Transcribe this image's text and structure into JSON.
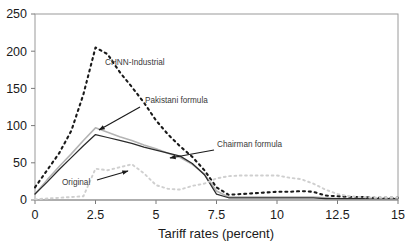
{
  "chart_data": {
    "type": "line",
    "title": "",
    "xlabel": "Tariff rates (percent)",
    "ylabel": "",
    "xlim": [
      0,
      15
    ],
    "ylim": [
      0,
      250
    ],
    "xticks": [
      "0",
      "2.5",
      "5",
      "7.5",
      "10",
      "12.5",
      "15"
    ],
    "xtick_values": [
      0,
      2.5,
      5,
      7.5,
      10,
      12.5,
      15
    ],
    "yticks": [
      "0",
      "50",
      "100",
      "150",
      "200",
      "250"
    ],
    "ytick_values": [
      0,
      50,
      100,
      150,
      200,
      250
    ],
    "grid": false,
    "legend_position": "inline-annotations",
    "x": [
      0,
      0.5,
      1,
      1.5,
      2,
      2.5,
      3,
      3.5,
      4,
      4.5,
      5,
      5.5,
      6,
      6.5,
      7,
      7.5,
      8,
      8.5,
      9,
      9.5,
      10,
      10.5,
      11,
      11.5,
      12,
      12.5,
      13,
      13.5,
      14,
      14.5,
      15
    ],
    "series": [
      {
        "name": "CHNN-Industrial",
        "color": "#1a1a1a",
        "style": "dotted",
        "width": 2.1,
        "values": [
          17,
          40,
          63,
          93,
          142,
          205,
          196,
          172,
          152,
          131,
          107,
          88,
          72,
          58,
          40,
          17,
          7,
          8,
          9,
          10,
          11,
          11,
          12,
          11,
          6,
          5,
          4,
          4,
          3,
          3,
          3
        ]
      },
      {
        "name": "Pakistani formula",
        "color": "#b4b4b4",
        "style": "solid",
        "width": 1.6,
        "values": [
          8,
          27,
          45,
          62,
          80,
          97,
          91,
          85,
          80,
          74,
          69,
          63,
          57,
          48,
          35,
          12,
          4,
          4,
          4,
          4,
          4,
          4,
          4,
          4,
          3,
          2,
          2,
          2,
          2,
          2,
          2
        ]
      },
      {
        "name": "Chairman formula",
        "color": "#2b2b2b",
        "style": "solid",
        "width": 1.25,
        "values": [
          8,
          24,
          41,
          57,
          73,
          88,
          84,
          80,
          76,
          71,
          67,
          63,
          59,
          49,
          34,
          8,
          3,
          3,
          3,
          3,
          3,
          3,
          3,
          3,
          2,
          2,
          2,
          2,
          2,
          2,
          2
        ]
      },
      {
        "name": "Original",
        "color": "#cfcfcf",
        "style": "dotted",
        "width": 1.9,
        "values": [
          1,
          2,
          3,
          4,
          5,
          42,
          40,
          44,
          48,
          36,
          20,
          15,
          14,
          19,
          22,
          29,
          32,
          33,
          33,
          33,
          33,
          30,
          28,
          22,
          14,
          8,
          5,
          4,
          3,
          3,
          3
        ]
      }
    ],
    "annotations": [
      {
        "name": "chnn-industrial",
        "label": "CHNN-Industrial",
        "text_x": 105,
        "text_y": 65,
        "arrow": false
      },
      {
        "name": "pakistani-formula",
        "label": "Pakistani formula",
        "text_x": 145,
        "text_y": 103,
        "arrow": true,
        "ax1": 140,
        "ay1": 107,
        "ax2": 99,
        "ay2": 130
      },
      {
        "name": "chairman-formula",
        "label": "Chairman formula",
        "text_x": 217,
        "text_y": 147,
        "arrow": true,
        "ax1": 214,
        "ay1": 150,
        "ax2": 170,
        "ay2": 158
      },
      {
        "name": "original",
        "label": "Original",
        "text_x": 62,
        "text_y": 185,
        "arrow": true,
        "ax1": 97,
        "ay1": 180,
        "ax2": 128,
        "ay2": 171
      }
    ]
  },
  "axes": {
    "frame_color": "#9a9a9a",
    "axis_color": "#7a7a7a"
  }
}
